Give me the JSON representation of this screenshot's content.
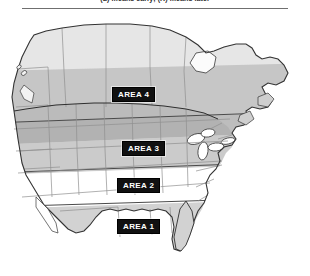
{
  "figure": {
    "caption": "(L) means early;  (R) means later",
    "title_rule": true
  },
  "map": {
    "name": "north-america-planting-zone-map",
    "regions": [
      {
        "id": "area4",
        "label": "AREA 4",
        "band": "northern",
        "fill": "#b9b9b9"
      },
      {
        "id": "area3",
        "label": "AREA 3",
        "band": "upper-central",
        "fill": "#cfcfcf"
      },
      {
        "id": "area2",
        "label": "AREA 2",
        "band": "lower-central",
        "fill": "#ffffff"
      },
      {
        "id": "area1",
        "label": "AREA 1",
        "band": "southern",
        "fill": "#d4d4d4"
      }
    ],
    "colors": {
      "canada_fill": "#e4e4e4",
      "band_dark": "#b9b9b9",
      "band_mid": "#cfcfcf",
      "band_light": "#d9d9d9",
      "band_white": "#ffffff",
      "outline": "#3a3a3a",
      "state_border": "#8d8d8d",
      "label_bg": "#111111",
      "label_text": "#ffffff"
    }
  },
  "labels": {
    "area1": "AREA 1",
    "area2": "AREA 2",
    "area3": "AREA 3",
    "area4": "AREA 4"
  }
}
